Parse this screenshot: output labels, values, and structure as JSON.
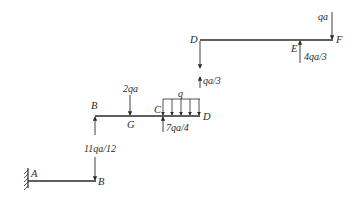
{
  "diagram": {
    "type": "beam free-body diagrams",
    "colors": {
      "line": "#2a2a2a",
      "background": "#ffffff"
    },
    "segments": [
      {
        "name": "AB",
        "points": {
          "A": "A",
          "B": "B"
        },
        "support": "fixed-wall-at-A",
        "loads": [
          {
            "label": "11qa/12",
            "at": "B",
            "direction": "down"
          }
        ]
      },
      {
        "name": "BD",
        "points": {
          "B": "B",
          "G": "G",
          "C": "C",
          "D": "D"
        },
        "loads": [
          {
            "label": "11qa/12",
            "at": "B",
            "direction": "up"
          },
          {
            "label": "2qa",
            "at": "G",
            "direction": "down"
          },
          {
            "label": "7qa/4",
            "at": "C",
            "direction": "up"
          },
          {
            "label": "q",
            "from": "C",
            "to": "D",
            "direction": "down",
            "kind": "distributed"
          },
          {
            "label": "qa/3",
            "at": "D",
            "direction": "up"
          }
        ]
      },
      {
        "name": "DF",
        "points": {
          "D": "D",
          "E": "E",
          "F": "F"
        },
        "loads": [
          {
            "label": "qa/3",
            "at": "D",
            "direction": "down"
          },
          {
            "label": "4qa/3",
            "at": "E",
            "direction": "up"
          },
          {
            "label": "qa",
            "at": "F",
            "direction": "down"
          }
        ]
      }
    ]
  }
}
